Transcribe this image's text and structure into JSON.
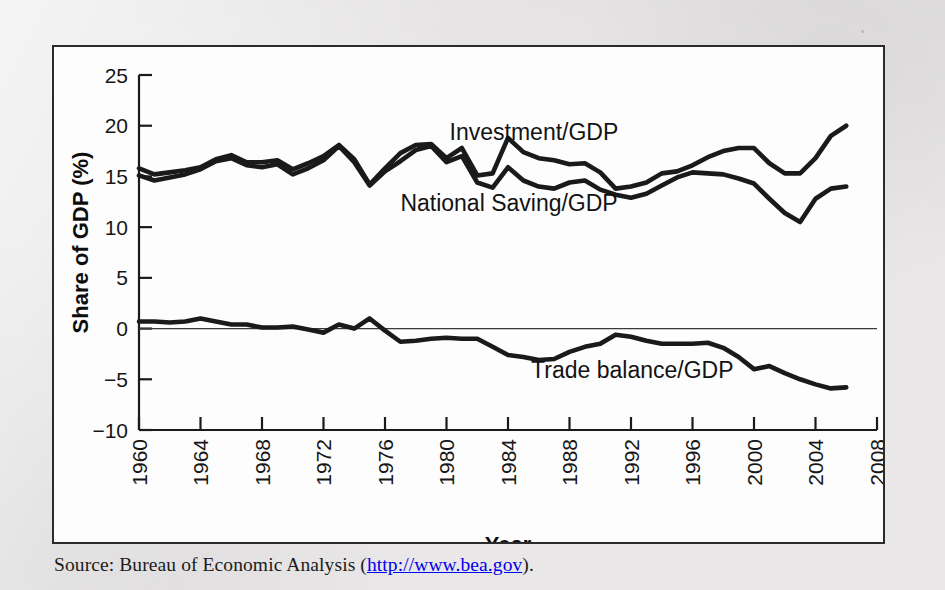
{
  "figure": {
    "source_prefix": "Source: Bureau of Economic Analysis (",
    "source_url": "http://www.bea.gov",
    "source_suffix": ").",
    "frame_color": "#2b2b2b",
    "ink_color": "#1a1a1a"
  },
  "chart_data": {
    "type": "line",
    "title": "",
    "subtitle": "",
    "xlabel": "Year",
    "ylabel": "Share of GDP (%)",
    "xlim": [
      1960,
      2008
    ],
    "ylim": [
      -10,
      25
    ],
    "xticks": [
      1960,
      1964,
      1968,
      1972,
      1976,
      1980,
      1984,
      1988,
      1992,
      1996,
      2000,
      2004,
      2008
    ],
    "xtick_labels": [
      "1960",
      "1964",
      "1968",
      "1972",
      "1976",
      "1980",
      "1984",
      "1988",
      "1992",
      "1996",
      "2000",
      "2004",
      "2008"
    ],
    "xtick_rotation": -90,
    "yticks": [
      -10,
      -5,
      0,
      5,
      10,
      15,
      20,
      25
    ],
    "ytick_labels": [
      "−10",
      "−5",
      "0",
      "5",
      "10",
      "15",
      "20",
      "25"
    ],
    "grid": false,
    "legend": "inline-annotations",
    "zero_line": true,
    "x": [
      1960,
      1961,
      1962,
      1963,
      1964,
      1965,
      1966,
      1967,
      1968,
      1969,
      1970,
      1971,
      1972,
      1973,
      1974,
      1975,
      1976,
      1977,
      1978,
      1979,
      1980,
      1981,
      1982,
      1983,
      1984,
      1985,
      1986,
      1987,
      1988,
      1989,
      1990,
      1991,
      1992,
      1993,
      1994,
      1995,
      1996,
      1997,
      1998,
      1999,
      2000,
      2001,
      2002,
      2003,
      2004,
      2005,
      2006
    ],
    "series": [
      {
        "name": "Investment/GDP",
        "label_text": "Investment/GDP",
        "color": "#1a1a1a",
        "linewidth": 4.6,
        "values": [
          15.8,
          15.2,
          15.4,
          15.6,
          15.9,
          16.7,
          17.1,
          16.4,
          16.4,
          16.6,
          15.7,
          16.3,
          17.0,
          18.1,
          16.7,
          14.2,
          15.8,
          17.3,
          18.1,
          18.2,
          16.8,
          17.8,
          15.1,
          15.3,
          18.8,
          17.4,
          16.8,
          16.6,
          16.2,
          16.3,
          15.4,
          13.8,
          14.0,
          14.4,
          15.3,
          15.5,
          16.1,
          16.9,
          17.5,
          17.8,
          17.8,
          16.3,
          15.3,
          15.3,
          16.8,
          19.0,
          20.0
        ]
      },
      {
        "name": "National Saving/GDP",
        "label_text": "National Saving/GDP",
        "color": "#1a1a1a",
        "linewidth": 4.6,
        "values": [
          15.1,
          14.6,
          14.9,
          15.2,
          15.7,
          16.5,
          16.8,
          16.1,
          15.9,
          16.2,
          15.2,
          15.8,
          16.6,
          18.0,
          16.4,
          14.1,
          15.5,
          16.5,
          17.6,
          18.0,
          16.4,
          17.0,
          14.4,
          13.9,
          15.9,
          14.6,
          14.0,
          13.8,
          14.4,
          14.6,
          13.7,
          13.2,
          12.9,
          13.3,
          14.1,
          14.9,
          15.4,
          15.3,
          15.2,
          14.8,
          14.3,
          12.8,
          11.4,
          10.5,
          12.8,
          13.8,
          14.0
        ]
      },
      {
        "name": "Trade balance/GDP",
        "label_text": "Trade balance/GDP",
        "color": "#1a1a1a",
        "linewidth": 4.6,
        "values": [
          0.7,
          0.7,
          0.6,
          0.7,
          1.0,
          0.7,
          0.4,
          0.4,
          0.1,
          0.1,
          0.2,
          -0.1,
          -0.4,
          0.4,
          0.0,
          1.0,
          -0.2,
          -1.3,
          -1.2,
          -1.0,
          -0.9,
          -1.0,
          -1.0,
          -1.8,
          -2.6,
          -2.8,
          -3.1,
          -3.0,
          -2.3,
          -1.8,
          -1.5,
          -0.6,
          -0.8,
          -1.2,
          -1.5,
          -1.5,
          -1.5,
          -1.4,
          -1.9,
          -2.8,
          -4.0,
          -3.7,
          -4.4,
          -5.0,
          -5.5,
          -5.9,
          -5.8
        ]
      }
    ],
    "annotations": [
      {
        "text": "Investment/GDP",
        "x": 1980.2,
        "y": 18.6
      },
      {
        "text": "National Saving/GDP",
        "x": 1977.0,
        "y": 11.6
      },
      {
        "text": "Trade balance/GDP",
        "x": 1985.5,
        "y": -4.9
      }
    ]
  }
}
